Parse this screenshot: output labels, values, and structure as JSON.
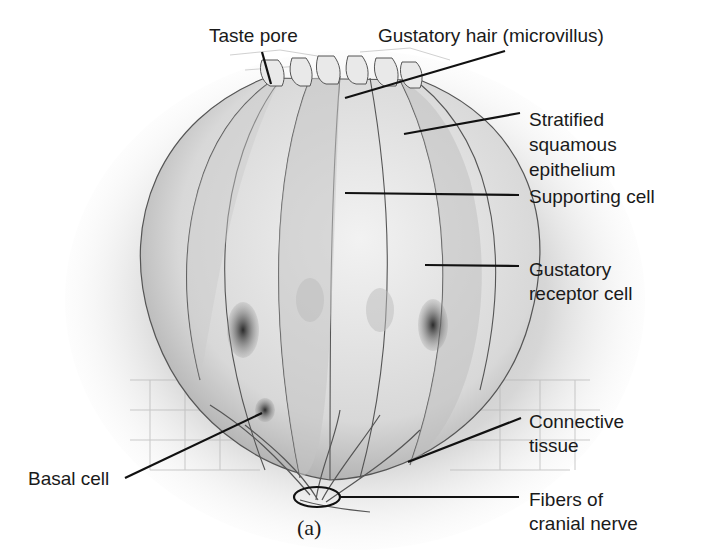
{
  "figure": {
    "caption": "(a)"
  },
  "labels": {
    "taste_pore": "Taste pore",
    "gustatory_hair": "Gustatory hair (microvillus)",
    "stratified_epithelium": "Stratified\nsquamous\nepithelium",
    "supporting_cell": "Supporting cell",
    "receptor_cell": "Gustatory\nreceptor cell",
    "connective_tissue": "Connective\ntissue",
    "basal_cell": "Basal cell",
    "nerve_fibers": "Fibers of\ncranial nerve"
  },
  "colors": {
    "ink": "#1a1a1a",
    "cell_fill": "#e6e6e6",
    "cell_shade": "#b8b8b8",
    "nucleus": "#4a4a4a",
    "background": "#ffffff"
  }
}
